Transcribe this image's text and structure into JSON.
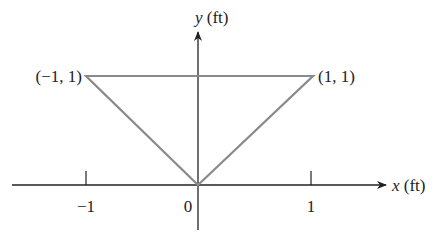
{
  "figure": {
    "x_axis_var": "x",
    "x_axis_unit": " (ft)",
    "y_axis_var": "y",
    "y_axis_unit": " (ft)",
    "x_ticks": [
      {
        "value": -1,
        "label": "−1"
      },
      {
        "value": 0,
        "label": "0"
      },
      {
        "value": 1,
        "label": "1"
      }
    ],
    "vertices": [
      {
        "label": "(−1, 1)",
        "x": -1,
        "y": 1
      },
      {
        "label": "(1, 1)",
        "x": 1,
        "y": 1
      },
      {
        "label": "",
        "x": 0,
        "y": 0
      }
    ],
    "shape": "triangle",
    "shape_color": "#8a8a8a",
    "axis_color": "#222222"
  }
}
